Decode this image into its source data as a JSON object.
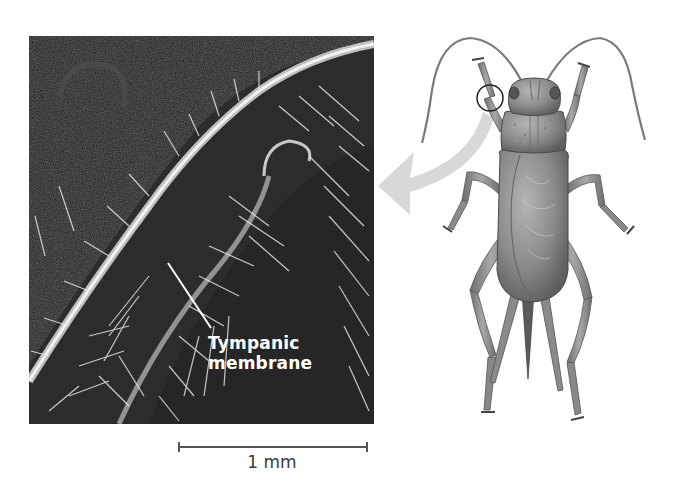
{
  "figure": {
    "micrograph": {
      "label_line1": "Tympanic",
      "label_line2": "membrane",
      "description": "Scanning electron micrograph of cricket foreleg showing tympanic membrane"
    },
    "scale_bar": {
      "label": "1 mm"
    },
    "illustration": {
      "subject": "cricket",
      "callout": "circle on foreleg",
      "arrow": "curved arrow pointing to micrograph"
    },
    "colors": {
      "micrograph_bg": "#1c1c1c",
      "hair": "#e6e6e6",
      "arrow": "#d8d8d8",
      "cricket_body": "#8a8a8a",
      "scale_bar": "#555555"
    }
  }
}
